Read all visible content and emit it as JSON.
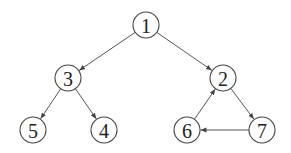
{
  "diagram": {
    "type": "directed-graph",
    "node_radius": 13,
    "nodes": [
      {
        "id": "1",
        "label": "1",
        "x": 146,
        "y": 25
      },
      {
        "id": "3",
        "label": "3",
        "x": 68,
        "y": 78
      },
      {
        "id": "2",
        "label": "2",
        "x": 223,
        "y": 78
      },
      {
        "id": "5",
        "label": "5",
        "x": 33,
        "y": 130
      },
      {
        "id": "4",
        "label": "4",
        "x": 104,
        "y": 130
      },
      {
        "id": "6",
        "label": "6",
        "x": 187,
        "y": 130
      },
      {
        "id": "7",
        "label": "7",
        "x": 262,
        "y": 130
      }
    ],
    "edges": [
      {
        "from": "1",
        "to": "3"
      },
      {
        "from": "1",
        "to": "2"
      },
      {
        "from": "3",
        "to": "5"
      },
      {
        "from": "3",
        "to": "4"
      },
      {
        "from": "2",
        "to": "7"
      },
      {
        "from": "7",
        "to": "6"
      },
      {
        "from": "6",
        "to": "2"
      }
    ],
    "colors": {
      "stroke": "#444444",
      "edge": "#555555",
      "fill": "#ffffff",
      "text": "#222222"
    }
  }
}
